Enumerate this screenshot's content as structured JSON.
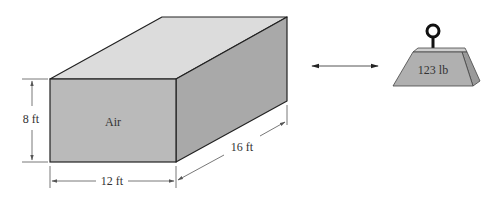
{
  "diagram": {
    "box": {
      "content_label": "Air",
      "height_label": "8 ft",
      "width_label": "12 ft",
      "depth_label": "16 ft",
      "colors": {
        "top_face": "#dcdcdc",
        "front_face": "#bababa",
        "side_face": "#a9a9a9",
        "edge": "#222222"
      }
    },
    "comparison_arrow": {
      "type": "double-headed",
      "color": "#555555"
    },
    "weight": {
      "label": "123 lb",
      "colors": {
        "front_face": "#b0b0b0",
        "top_face": "#cfcfcf",
        "side_face": "#9a9a9a",
        "ring": "#111111"
      }
    }
  }
}
